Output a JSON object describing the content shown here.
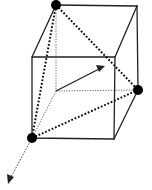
{
  "diagram": {
    "type": "cube-geometry",
    "colors": {
      "line": "#222222",
      "atom": "#000000",
      "background": "#ffffff"
    },
    "vertices": {
      "back_top_left": [
        56,
        5
      ],
      "back_top_right": [
        137,
        6
      ],
      "back_bottom_right": [
        138,
        90
      ],
      "back_bottom_left": [
        56,
        91
      ],
      "front_top_left": [
        32,
        57
      ],
      "front_top_right": [
        115,
        57
      ],
      "front_bottom_right": [
        114,
        139
      ],
      "front_bottom_left": [
        32,
        138
      ]
    },
    "atoms": [
      {
        "name": "atom-top",
        "at": [
          56,
          5
        ],
        "r": 5
      },
      {
        "name": "atom-right",
        "at": [
          138,
          90
        ],
        "r": 5
      },
      {
        "name": "atom-bottom-left",
        "at": [
          32,
          138
        ],
        "r": 5
      }
    ],
    "vector_arrow": {
      "from": [
        56,
        91
      ],
      "to": [
        105,
        66
      ]
    },
    "axis_arrow": {
      "from": [
        32,
        138
      ],
      "to": [
        8,
        183
      ]
    }
  }
}
